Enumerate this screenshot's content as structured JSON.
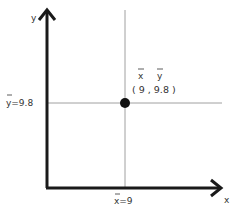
{
  "diagram": {
    "axes": {
      "x_label": "x",
      "y_label": "y"
    },
    "point": {
      "x": 9,
      "y": 9.8,
      "symbol_labels": {
        "x": "x",
        "y": "y"
      },
      "coord_label": "( 9 , 9.8 )"
    },
    "reference_lines": {
      "x_mean_label": "x=9",
      "y_mean_label": "y=9.8"
    }
  },
  "colors": {
    "axis": "#1a1a1a",
    "guide": "#888888",
    "point": "#111111",
    "text": "#333333"
  }
}
